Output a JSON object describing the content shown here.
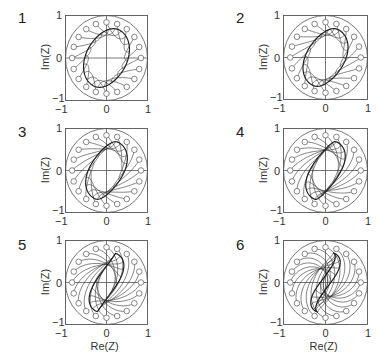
{
  "figure": {
    "axis_labels": {
      "x": "Re(Z)",
      "y": "Im(Z)"
    },
    "tick_labels": {
      "x": [
        "-1",
        "0",
        "1"
      ],
      "y": [
        "1",
        "0",
        "-1"
      ]
    }
  },
  "chart_data": [
    {
      "panel": "1",
      "type": "line",
      "xlabel": "",
      "ylabel": "Im(Z)",
      "xlim": [
        -1,
        1
      ],
      "ylim": [
        -1,
        1
      ],
      "xticks": [
        -1,
        0,
        1
      ],
      "yticks": [
        -1,
        0,
        1
      ],
      "unit_circle_radius": 1,
      "markers": 20,
      "marker_radius": 0.83,
      "description": "Trajectories from 20 circle markers on a ring converge onto a tilted elliptical limit curve",
      "twist": 0.35
    },
    {
      "panel": "2",
      "type": "line",
      "xlabel": "",
      "ylabel": "Im(Z)",
      "xlim": [
        -1,
        1
      ],
      "ylim": [
        -1,
        1
      ],
      "xticks": [
        -1,
        0,
        1
      ],
      "yticks": [
        -1,
        0,
        1
      ],
      "unit_circle_radius": 1,
      "markers": 20,
      "marker_radius": 0.83,
      "description": "Limit curve narrower tilted ellipse; trajectories curve more",
      "twist": 0.6
    },
    {
      "panel": "3",
      "type": "line",
      "xlabel": "",
      "ylabel": "Im(Z)",
      "xlim": [
        -1,
        1
      ],
      "ylim": [
        -1,
        1
      ],
      "xticks": [
        -1,
        0,
        1
      ],
      "yticks": [
        -1,
        0,
        1
      ],
      "unit_circle_radius": 1,
      "markers": 20,
      "marker_radius": 0.83,
      "description": "Limit curve becomes an S-shaped narrow loop",
      "twist": 0.9
    },
    {
      "panel": "4",
      "type": "line",
      "xlabel": "",
      "ylabel": "Im(Z)",
      "xlim": [
        -1,
        1
      ],
      "ylim": [
        -1,
        1
      ],
      "xticks": [
        -1,
        0,
        1
      ],
      "yticks": [
        -1,
        0,
        1
      ],
      "unit_circle_radius": 1,
      "markers": 20,
      "marker_radius": 0.83,
      "description": "Trajectories spiral into S-shaped limit curve",
      "twist": 1.3
    },
    {
      "panel": "5",
      "type": "line",
      "xlabel": "Re(Z)",
      "ylabel": "Im(Z)",
      "xlim": [
        -1,
        1
      ],
      "ylim": [
        -1,
        1
      ],
      "xticks": [
        -1,
        0,
        1
      ],
      "yticks": [
        -1,
        0,
        1
      ],
      "unit_circle_radius": 1,
      "markers": 20,
      "marker_radius": 0.83,
      "description": "Stronger spiral arms converging to S-curve",
      "twist": 1.8
    },
    {
      "panel": "6",
      "type": "line",
      "xlabel": "Re(Z)",
      "ylabel": "Im(Z)",
      "xlim": [
        -1,
        1
      ],
      "ylim": [
        -1,
        1
      ],
      "xticks": [
        -1,
        0,
        1
      ],
      "yticks": [
        -1,
        0,
        1
      ],
      "unit_circle_radius": 1,
      "markers": 20,
      "marker_radius": 0.83,
      "description": "Spiral arms wind tightly into the origin forming an S-shaped vortex",
      "twist": 2.6
    }
  ],
  "layout": {
    "panels": [
      {
        "x": 65,
        "y": 15,
        "w": 83,
        "h": 86,
        "num_x": 18,
        "num_y": 9,
        "show_xlabel": false
      },
      {
        "x": 283,
        "y": 15,
        "w": 85,
        "h": 85,
        "num_x": 236,
        "num_y": 9,
        "show_xlabel": false
      },
      {
        "x": 65,
        "y": 128,
        "w": 83,
        "h": 85,
        "num_x": 18,
        "num_y": 123,
        "show_xlabel": false
      },
      {
        "x": 283,
        "y": 128,
        "w": 85,
        "h": 85,
        "num_x": 236,
        "num_y": 123,
        "show_xlabel": false
      },
      {
        "x": 65,
        "y": 240,
        "w": 83,
        "h": 85,
        "num_x": 18,
        "num_y": 236,
        "show_xlabel": true
      },
      {
        "x": 283,
        "y": 240,
        "w": 85,
        "h": 85,
        "num_x": 236,
        "num_y": 236,
        "show_xlabel": true
      }
    ],
    "colors": {
      "line": "#333333",
      "box": "#555555",
      "marker": "#555555"
    }
  }
}
